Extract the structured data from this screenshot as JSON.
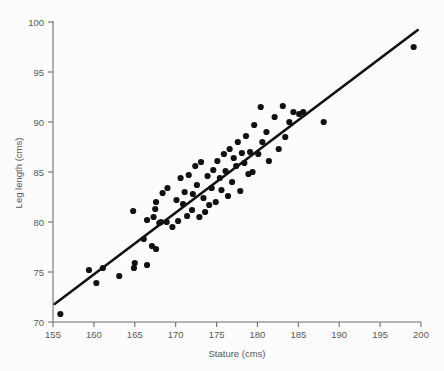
{
  "chart_data": {
    "type": "scatter",
    "title": "",
    "xlabel": "Stature (cms)",
    "ylabel": "Leg length (cms)",
    "xlim": [
      155,
      200
    ],
    "ylim": [
      70,
      100
    ],
    "xticks": [
      155,
      160,
      165,
      170,
      175,
      180,
      185,
      190,
      195,
      200
    ],
    "yticks": [
      70,
      75,
      80,
      85,
      90,
      95,
      100
    ],
    "grid": false,
    "legend": null,
    "marker": "filled-circle",
    "marker_color": "#111111",
    "trendline": {
      "type": "linear-fit",
      "color": "#111111",
      "x_start": 155.2,
      "y_start": 71.8,
      "x_end": 199.6,
      "y_end": 99.2
    },
    "points": [
      [
        155.9,
        70.8
      ],
      [
        159.4,
        75.2
      ],
      [
        161.1,
        75.4
      ],
      [
        160.3,
        73.9
      ],
      [
        163.1,
        74.6
      ],
      [
        164.9,
        75.4
      ],
      [
        165.0,
        75.9
      ],
      [
        166.5,
        75.7
      ],
      [
        164.8,
        81.1
      ],
      [
        166.1,
        78.3
      ],
      [
        167.1,
        77.6
      ],
      [
        167.6,
        77.3
      ],
      [
        166.5,
        80.2
      ],
      [
        167.3,
        80.5
      ],
      [
        167.5,
        81.3
      ],
      [
        167.6,
        82.0
      ],
      [
        168.0,
        79.9
      ],
      [
        168.2,
        80.0
      ],
      [
        168.4,
        82.9
      ],
      [
        168.9,
        80.0
      ],
      [
        169.0,
        83.4
      ],
      [
        169.6,
        79.5
      ],
      [
        170.1,
        82.2
      ],
      [
        170.3,
        80.1
      ],
      [
        170.6,
        84.4
      ],
      [
        170.9,
        81.8
      ],
      [
        171.1,
        83.0
      ],
      [
        171.4,
        80.6
      ],
      [
        171.6,
        84.7
      ],
      [
        172.0,
        81.2
      ],
      [
        172.1,
        82.8
      ],
      [
        172.4,
        85.6
      ],
      [
        172.6,
        83.7
      ],
      [
        172.9,
        80.5
      ],
      [
        173.1,
        86.0
      ],
      [
        173.4,
        82.4
      ],
      [
        173.6,
        81.0
      ],
      [
        173.9,
        84.6
      ],
      [
        174.1,
        81.7
      ],
      [
        174.4,
        83.4
      ],
      [
        174.6,
        85.2
      ],
      [
        174.9,
        82.0
      ],
      [
        175.1,
        86.1
      ],
      [
        175.4,
        84.4
      ],
      [
        175.6,
        83.2
      ],
      [
        175.9,
        86.8
      ],
      [
        176.1,
        85.1
      ],
      [
        176.4,
        82.6
      ],
      [
        176.6,
        87.3
      ],
      [
        176.9,
        84.0
      ],
      [
        177.1,
        86.4
      ],
      [
        177.4,
        85.6
      ],
      [
        177.6,
        88.0
      ],
      [
        177.9,
        83.1
      ],
      [
        178.1,
        86.9
      ],
      [
        178.4,
        85.9
      ],
      [
        178.6,
        88.6
      ],
      [
        178.9,
        84.8
      ],
      [
        179.1,
        87.0
      ],
      [
        179.4,
        85.0
      ],
      [
        179.6,
        89.7
      ],
      [
        180.1,
        86.8
      ],
      [
        180.4,
        91.5
      ],
      [
        180.6,
        88.0
      ],
      [
        181.1,
        89.0
      ],
      [
        181.4,
        86.1
      ],
      [
        182.1,
        90.5
      ],
      [
        182.6,
        87.3
      ],
      [
        183.1,
        91.6
      ],
      [
        183.4,
        88.5
      ],
      [
        183.9,
        90.0
      ],
      [
        184.4,
        91.0
      ],
      [
        185.1,
        90.8
      ],
      [
        185.6,
        91.0
      ],
      [
        188.1,
        90.0
      ],
      [
        199.1,
        97.5
      ]
    ]
  }
}
